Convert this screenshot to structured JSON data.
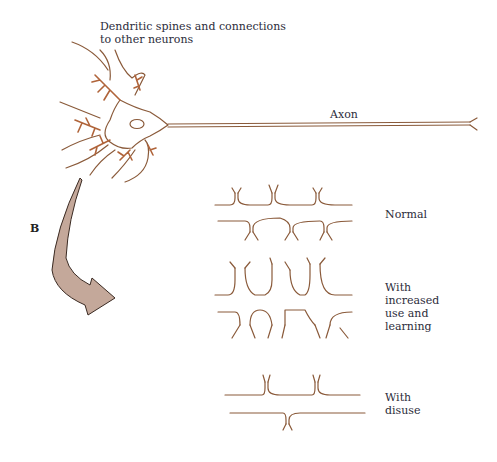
{
  "figure": {
    "panel_letter": "B",
    "labels": {
      "dendritic_spines": "Dendritic spines and connections to other neurons",
      "dendritic_line1": "Dendritic spines and connections",
      "dendritic_line2": "to other neurons",
      "axon": "Axon"
    },
    "conditions": [
      {
        "id": "normal",
        "label_lines": [
          "Normal"
        ]
      },
      {
        "id": "increased",
        "label_lines": [
          "With",
          "increased",
          "use and",
          "learning"
        ]
      },
      {
        "id": "disuse",
        "label_lines": [
          "With",
          "disuse"
        ]
      }
    ],
    "colors": {
      "neuron_line": "#8a5a3a",
      "spines": "#b0643a",
      "arrow_fill": "#c4a89a",
      "arrow_stroke": "#3a2a22",
      "text": "#2c2c3a"
    }
  }
}
